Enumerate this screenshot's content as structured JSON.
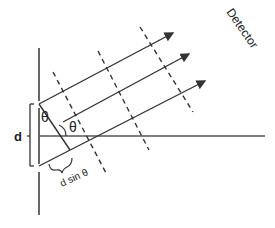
{
  "diagram": {
    "labels": {
      "detector": "Detector",
      "slit_spacing": "d",
      "angle_top": "θ",
      "angle_right": "θ",
      "path_difference": "d sin θ"
    },
    "colors": {
      "line": "#333333",
      "background": "#ffffff"
    }
  }
}
